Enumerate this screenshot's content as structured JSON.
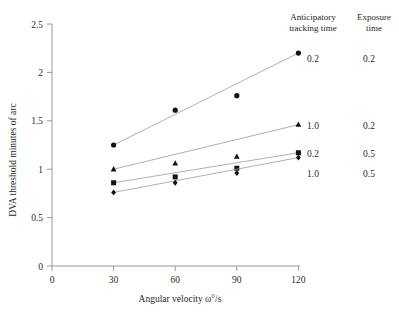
{
  "chart_data": {
    "type": "line",
    "title": "",
    "xlabel": "Angular velocity ω°/s",
    "ylabel": "DVA threshold minutes of arc",
    "x": [
      30,
      60,
      90,
      120
    ],
    "xlim": [
      0,
      125
    ],
    "ylim": [
      0,
      2.5
    ],
    "xticks": [
      "0",
      "30",
      "60",
      "90",
      "120"
    ],
    "xtick_values": [
      0,
      30,
      60,
      90,
      120
    ],
    "yticks": [
      "0",
      "0.5",
      "1",
      "1.5",
      "2",
      "2.5"
    ],
    "ytick_values": [
      0,
      0.5,
      1,
      1.5,
      2,
      2.5
    ],
    "grid": false,
    "legend_position": "right",
    "series": [
      {
        "name": "anticipatory 0.2 / exposure 0.2",
        "marker": "circle",
        "anticipatory_tracking_time": "0.2",
        "exposure_time": "0.2",
        "values": [
          1.25,
          1.61,
          1.76,
          2.2
        ]
      },
      {
        "name": "anticipatory 1.0 / exposure 0.2",
        "marker": "triangle",
        "anticipatory_tracking_time": "1.0",
        "exposure_time": "0.2",
        "values": [
          1.0,
          1.06,
          1.13,
          1.46
        ]
      },
      {
        "name": "anticipatory 0.2 / exposure 0.5",
        "marker": "square",
        "anticipatory_tracking_time": "0.2",
        "exposure_time": "0.5",
        "values": [
          0.86,
          0.92,
          1.01,
          1.17
        ]
      },
      {
        "name": "anticipatory 1.0 / exposure 0.5",
        "marker": "diamond",
        "anticipatory_tracking_time": "1.0",
        "exposure_time": "0.5",
        "values": [
          0.76,
          0.86,
          0.96,
          1.12
        ]
      }
    ]
  },
  "legend": {
    "header_anticipatory": "Anticipatory tracking time",
    "header_exposure": "Exposure time",
    "rows": [
      {
        "anticipatory": "0.2",
        "exposure": "0.2"
      },
      {
        "anticipatory": "1.0",
        "exposure": "0.2"
      },
      {
        "anticipatory": "0.2",
        "exposure": "0.5"
      },
      {
        "anticipatory": "1.0",
        "exposure": "0.5"
      }
    ]
  },
  "colors": {
    "marker": "#121212",
    "line": "#9a9a9a",
    "axis": "#8c8c8c",
    "text": "#1f1f1f",
    "background": "#ffffff"
  }
}
